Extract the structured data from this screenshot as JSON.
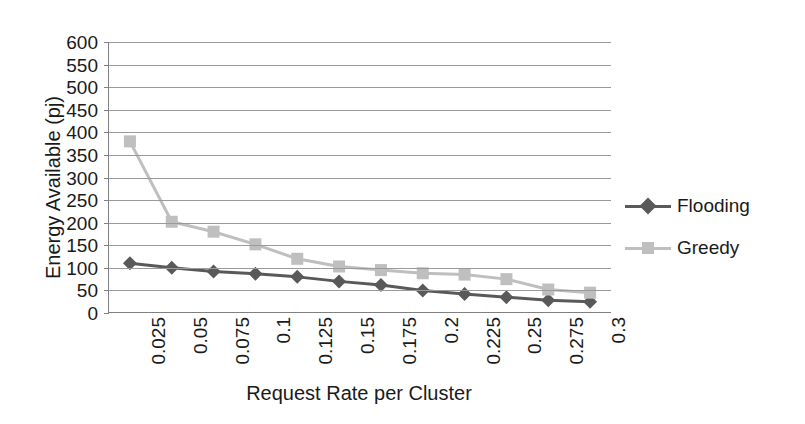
{
  "chart_data": {
    "type": "line",
    "title": "",
    "xlabel": "Request Rate per Cluster",
    "ylabel": "Energy Available (pj)",
    "categories": [
      "0.025",
      "0.05",
      "0.075",
      "0.1",
      "0.125",
      "0.15",
      "0.175",
      "0.2",
      "0.225",
      "0.25",
      "0.275",
      "0.3"
    ],
    "ylim": [
      0,
      600
    ],
    "ytick_labels": [
      "600",
      "550",
      "500",
      "450",
      "400",
      "350",
      "300",
      "250",
      "200",
      "150",
      "100",
      "50",
      "0"
    ],
    "ytick_values": [
      600,
      550,
      500,
      450,
      400,
      350,
      300,
      250,
      200,
      150,
      100,
      50,
      0
    ],
    "ytick_step": 50,
    "grid": true,
    "legend_position": "right",
    "series": [
      {
        "name": "Flooding",
        "color": "#595959",
        "marker": "diamond",
        "values": [
          110,
          100,
          92,
          87,
          80,
          70,
          62,
          50,
          42,
          35,
          28,
          25
        ]
      },
      {
        "name": "Greedy",
        "color": "#bfbfbf",
        "marker": "square",
        "values": [
          380,
          202,
          180,
          152,
          120,
          103,
          95,
          88,
          85,
          75,
          52,
          45
        ]
      }
    ]
  },
  "legend": {
    "items": [
      {
        "label": "Flooding"
      },
      {
        "label": "Greedy"
      }
    ]
  }
}
